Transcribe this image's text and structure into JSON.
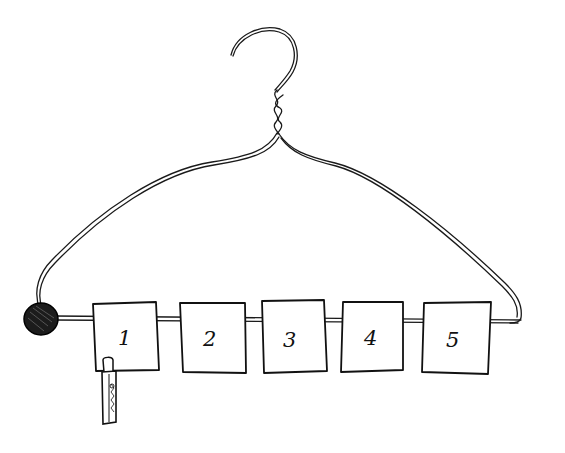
{
  "drawing": {
    "subject": "wire coat hanger with numbered cards",
    "cards": [
      {
        "label": "1",
        "has_clothespin": true
      },
      {
        "label": "2",
        "has_clothespin": false
      },
      {
        "label": "3",
        "has_clothespin": false
      },
      {
        "label": "4",
        "has_clothespin": false
      },
      {
        "label": "5",
        "has_clothespin": false
      }
    ],
    "end_knob": "dark-knob",
    "colors": {
      "ink": "#111111",
      "paper": "#ffffff"
    }
  }
}
